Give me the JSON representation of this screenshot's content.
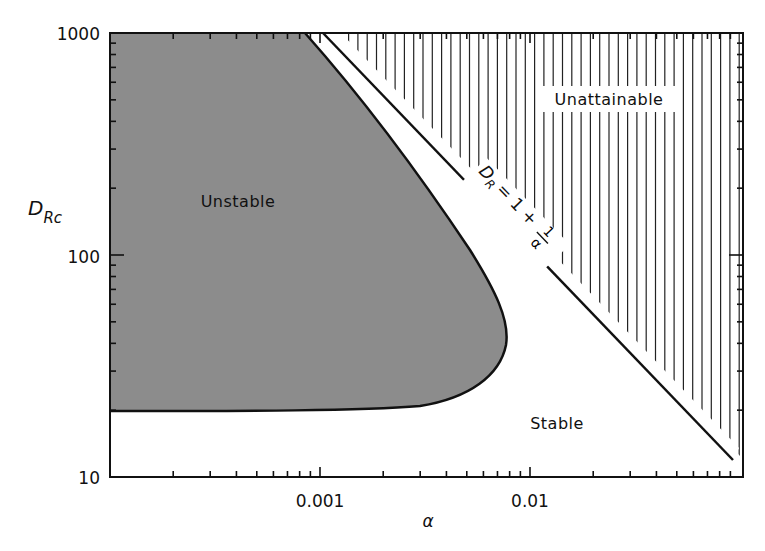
{
  "chart_data": {
    "type": "area",
    "title": "",
    "xlabel": "α",
    "ylabel": "D_Rc",
    "xscale": "log",
    "yscale": "log",
    "xlim": [
      0.0001,
      0.1
    ],
    "ylim": [
      10,
      1000
    ],
    "grid": false,
    "x_ticks": [
      {
        "value": 0.001,
        "label": "0.001"
      },
      {
        "value": 0.01,
        "label": "0.01"
      }
    ],
    "y_ticks": [
      {
        "value": 1000,
        "label": "1000"
      },
      {
        "value": 100,
        "label": "100"
      },
      {
        "value": 10,
        "label": "10"
      }
    ],
    "regions": [
      {
        "name": "Unstable",
        "fill": "#8c8c8c",
        "boundary": [
          {
            "alpha": 0.00085,
            "D": 1000
          },
          {
            "alpha": 0.0015,
            "D": 500
          },
          {
            "alpha": 0.0029,
            "D": 220
          },
          {
            "alpha": 0.005,
            "D": 106
          },
          {
            "alpha": 0.0069,
            "D": 63
          },
          {
            "alpha": 0.0078,
            "D": 44
          },
          {
            "alpha": 0.0073,
            "D": 30
          },
          {
            "alpha": 0.005,
            "D": 23
          },
          {
            "alpha": 0.0029,
            "D": 21
          },
          {
            "alpha": 0.0013,
            "D": 20
          },
          {
            "alpha": 0.0001,
            "D": 20
          }
        ]
      },
      {
        "name": "Stable",
        "fill": "#ffffff"
      },
      {
        "name": "Unattainable",
        "fill": "hatched-vertical",
        "boundary_equation": "D_R = 1 + 1/α"
      }
    ],
    "series": [
      {
        "name": "D_R = 1 + 1/α",
        "type": "line",
        "points": [
          {
            "alpha": 0.001,
            "D": 1001
          },
          {
            "alpha": 0.01,
            "D": 101
          },
          {
            "alpha": 0.093,
            "D": 11.75
          }
        ]
      }
    ],
    "annotations": [
      {
        "text": "Unstable",
        "alpha": 0.00025,
        "D": 300
      },
      {
        "text": "Unattainable",
        "alpha": 0.03,
        "D": 600
      },
      {
        "text": "Stable",
        "alpha": 0.014,
        "D": 18
      },
      {
        "text": "D_R = 1 + 1/α",
        "rotated": true,
        "along": "boundary line"
      }
    ]
  },
  "labels": {
    "y_axis_main": "D",
    "y_axis_sub": "Rc",
    "x_axis": "α",
    "y_tick_1000": "1000",
    "y_tick_100": "100",
    "y_tick_10": "10",
    "x_tick_0001": "0.001",
    "x_tick_001": "0.01",
    "region_unstable": "Unstable",
    "region_unattainable": "Unattainable",
    "region_stable": "Stable",
    "eq_D": "D",
    "eq_R": "R",
    "eq_rest": "= 1 +",
    "eq_num": "1",
    "eq_den": "α"
  },
  "colors": {
    "unstable_fill": "#8c8c8c",
    "line": "#111111",
    "hatch": "#222222"
  }
}
